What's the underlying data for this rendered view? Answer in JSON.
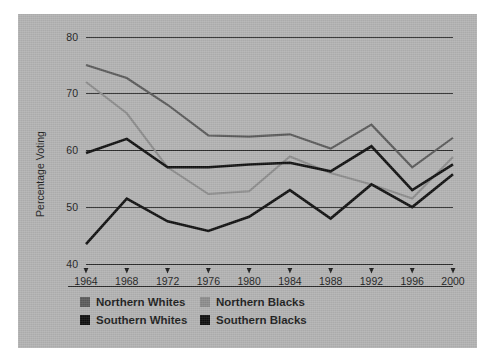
{
  "figure": {
    "plate_background": "#b2b2b2",
    "page_background": "#ffffff"
  },
  "chart_data": {
    "type": "line",
    "title": "",
    "subtitle": "",
    "xlabel": "",
    "ylabel": "Percentage Voting",
    "categories": [
      "1964",
      "1968",
      "1972",
      "1976",
      "1980",
      "1984",
      "1988",
      "1992",
      "1996",
      "2000"
    ],
    "x": [
      1964,
      1968,
      1972,
      1976,
      1980,
      1984,
      1988,
      1992,
      1996,
      2000
    ],
    "xlim": [
      1964,
      2000
    ],
    "ylim": [
      40,
      80
    ],
    "yticks": [
      40,
      50,
      60,
      70,
      80
    ],
    "ytick_labels": [
      "40",
      "50",
      "60",
      "70",
      "80"
    ],
    "grid": "horizontal",
    "legend_position": "bottom-left",
    "series": [
      {
        "name": "Northern Whites",
        "color": "#5a5a5a",
        "stroke_width": 2.1,
        "values": [
          75.0,
          72.7,
          68.0,
          62.6,
          62.4,
          62.8,
          60.3,
          64.5,
          57.0,
          62.2
        ]
      },
      {
        "name": "Northern Blacks",
        "color": "#8c8c8c",
        "stroke_width": 2.1,
        "values": [
          72.0,
          66.5,
          57.0,
          52.3,
          52.8,
          58.9,
          56.0,
          54.0,
          51.5,
          58.8
        ]
      },
      {
        "name": "Southern Whites",
        "color": "#101010",
        "stroke_width": 2.6,
        "values": [
          59.5,
          62.0,
          57.0,
          57.0,
          57.5,
          57.8,
          56.3,
          60.7,
          53.0,
          57.5
        ]
      },
      {
        "name": "Southern Blacks",
        "color": "#101010",
        "stroke_width": 2.6,
        "values": [
          43.5,
          51.5,
          47.5,
          45.8,
          48.3,
          53.0,
          48.0,
          54.0,
          50.0,
          55.8
        ]
      }
    ]
  },
  "legend": {
    "entries": [
      {
        "label": "Northern Whites",
        "color": "#5a5a5a",
        "row": 0,
        "col": 0
      },
      {
        "label": "Northern Blacks",
        "color": "#8c8c8c",
        "row": 0,
        "col": 1
      },
      {
        "label": "Southern Whites",
        "color": "#101010",
        "row": 1,
        "col": 0
      },
      {
        "label": "Southern Blacks",
        "color": "#101010",
        "row": 1,
        "col": 1
      }
    ]
  }
}
